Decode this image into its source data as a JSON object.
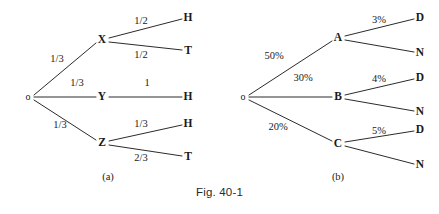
{
  "figure": {
    "caption": "Fig. 40-1"
  },
  "diagram_a": {
    "part_label": "(a)",
    "root": {
      "label": "o",
      "x": 28,
      "y": 97
    },
    "level1": [
      {
        "label": "X",
        "x": 102,
        "y": 40
      },
      {
        "label": "Y",
        "x": 102,
        "y": 97
      },
      {
        "label": "Z",
        "x": 102,
        "y": 143
      }
    ],
    "leaves": [
      {
        "label": "H",
        "x": 188,
        "y": 18
      },
      {
        "label": "T",
        "x": 188,
        "y": 51
      },
      {
        "label": "H",
        "x": 188,
        "y": 97
      },
      {
        "label": "H",
        "x": 188,
        "y": 124
      },
      {
        "label": "T",
        "x": 188,
        "y": 157
      }
    ],
    "edge_labels": [
      {
        "text": "1/3",
        "x": 57,
        "y": 59
      },
      {
        "text": "1/3",
        "x": 77,
        "y": 83
      },
      {
        "text": "1/3",
        "x": 60,
        "y": 125
      },
      {
        "text": "1/2",
        "x": 141,
        "y": 21
      },
      {
        "text": "1/2",
        "x": 141,
        "y": 55
      },
      {
        "text": "1",
        "x": 147,
        "y": 83
      },
      {
        "text": "1/3",
        "x": 141,
        "y": 124
      },
      {
        "text": "2/3",
        "x": 141,
        "y": 158
      }
    ]
  },
  "diagram_b": {
    "part_label": "(b)",
    "root": {
      "label": "o",
      "x": 243,
      "y": 97
    },
    "level1": [
      {
        "label": "A",
        "x": 338,
        "y": 38
      },
      {
        "label": "B",
        "x": 338,
        "y": 97
      },
      {
        "label": "C",
        "x": 338,
        "y": 144
      }
    ],
    "leaves": [
      {
        "label": "D",
        "x": 420,
        "y": 18
      },
      {
        "label": "N",
        "x": 420,
        "y": 53
      },
      {
        "label": "D",
        "x": 420,
        "y": 78
      },
      {
        "label": "N",
        "x": 420,
        "y": 112
      },
      {
        "label": "D",
        "x": 420,
        "y": 130
      },
      {
        "label": "N",
        "x": 420,
        "y": 165
      }
    ],
    "edge_labels": [
      {
        "text": "50%",
        "x": 274,
        "y": 56
      },
      {
        "text": "30%",
        "x": 303,
        "y": 78
      },
      {
        "text": "20%",
        "x": 278,
        "y": 127
      },
      {
        "text": "3%",
        "x": 379,
        "y": 20
      },
      {
        "text": "4%",
        "x": 379,
        "y": 79
      },
      {
        "text": "5%",
        "x": 379,
        "y": 131
      }
    ]
  },
  "colors": {
    "line": "#2b2b2b",
    "text": "#1a1a1a",
    "background": "#ffffff"
  }
}
